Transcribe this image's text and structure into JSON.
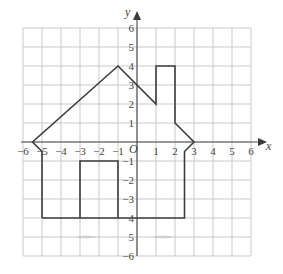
{
  "figure": {
    "x_axis_label": "x",
    "y_axis_label": "y",
    "origin_label": "O",
    "x_range": [
      -6,
      6
    ],
    "y_range": [
      -6,
      6
    ],
    "x_tick_labels": [
      "−6",
      "−5",
      "−4",
      "−3",
      "−2",
      "−1",
      "1",
      "2",
      "3",
      "4",
      "5",
      "6"
    ],
    "y_tick_labels_positive": [
      "1",
      "2",
      "3",
      "4",
      "5",
      "6"
    ],
    "y_tick_labels_negative": [
      "−1",
      "−2",
      "−3",
      "4",
      "5",
      "−6"
    ],
    "colors": {
      "grid": "#c9c9c9",
      "axis": "#4a4a4a",
      "shape": "#3c3c3c",
      "text": "#444444"
    }
  },
  "shapes": {
    "house_outline": [
      [
        -5,
        -4
      ],
      [
        -5,
        -0.5
      ],
      [
        -5.5,
        0
      ],
      [
        -1,
        4
      ],
      [
        1,
        2
      ],
      [
        1,
        4
      ],
      [
        2,
        4
      ],
      [
        2,
        1
      ],
      [
        3,
        0
      ],
      [
        2.5,
        -0.5
      ],
      [
        2.5,
        -4
      ],
      [
        -5,
        -4
      ]
    ],
    "door": [
      [
        -3,
        -4
      ],
      [
        -3,
        -1
      ],
      [
        -1,
        -1
      ],
      [
        -1,
        -4
      ]
    ]
  }
}
